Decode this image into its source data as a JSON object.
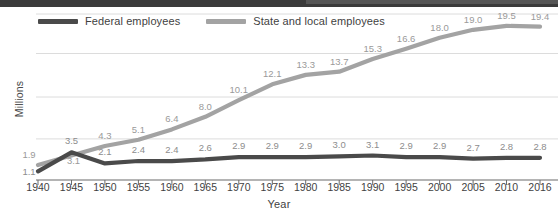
{
  "chart_data": {
    "type": "line",
    "title": "",
    "xlabel": "Year",
    "ylabel": "Millions",
    "categories": [
      "1940",
      "1945",
      "1950",
      "1955",
      "1960",
      "1965",
      "1970",
      "1975",
      "1980",
      "1985",
      "1990",
      "1995",
      "2000",
      "2005",
      "2010",
      "2016"
    ],
    "xlim": [
      1940,
      2016
    ],
    "ylim": [
      0,
      21
    ],
    "grid": true,
    "legend_position": "top-left",
    "series": [
      {
        "name": "Federal employees",
        "color": "#4a4a4a",
        "values": [
          1.1,
          3.5,
          2.1,
          2.4,
          2.4,
          2.6,
          2.9,
          2.9,
          2.9,
          3.0,
          3.1,
          2.9,
          2.9,
          2.7,
          2.8,
          2.8
        ],
        "labels": [
          "1.1",
          "3.5",
          "2.1",
          "2.4",
          "2.4",
          "2.6",
          "2.9",
          "2.9",
          "2.9",
          "3.0",
          "3.1",
          "2.9",
          "2.9",
          "2.7",
          "2.8",
          "2.8"
        ]
      },
      {
        "name": "State and local employees",
        "color": "#a3a3a3",
        "values": [
          1.9,
          3.1,
          4.3,
          5.1,
          6.4,
          8.0,
          10.1,
          12.1,
          13.3,
          13.7,
          15.3,
          16.6,
          18.0,
          19.0,
          19.5,
          19.4
        ],
        "labels": [
          "1.9",
          "3.1",
          "4.3",
          "5.1",
          "6.4",
          "8.0",
          "10.1",
          "12.1",
          "13.3",
          "13.7",
          "15.3",
          "16.6",
          "18.0",
          "19.0",
          "19.5",
          "19.4"
        ]
      }
    ]
  },
  "legend": {
    "items": [
      {
        "label": "Federal employees",
        "color": "#4a4a4a"
      },
      {
        "label": "State and local employees",
        "color": "#a3a3a3"
      }
    ]
  },
  "axes": {
    "y_title": "Millions",
    "x_title": "Year",
    "x_ticks": [
      "1940",
      "1945",
      "1950",
      "1955",
      "1960",
      "1965",
      "1970",
      "1975",
      "1980",
      "1985",
      "1990",
      "1995",
      "2000",
      "2005",
      "2010",
      "2016"
    ]
  }
}
